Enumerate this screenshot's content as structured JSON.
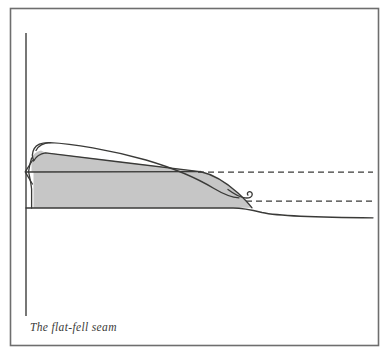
{
  "figure": {
    "caption": "The flat-fell seam",
    "background_color": "#ffffff",
    "frame": {
      "name": "figure-border",
      "color": "#6e6e6e",
      "x": 10.5,
      "y": 8.5,
      "width": 368,
      "height": 337,
      "stroke_width": 1.6
    },
    "ink_color": "#3a3a38",
    "fill_color": "#c6c6c6",
    "line_width": 1.3,
    "elements": {
      "vertical_rule": {
        "name": "vertical-reference-line",
        "label": "vertical reference line",
        "x": 26,
        "y_top": 33,
        "y_bottom": 316,
        "style": "solid",
        "color": "#4a4a48"
      },
      "shaded_body": {
        "name": "seam-shaded-body",
        "label": "shaded fabric cross-section",
        "fill": "#c6c6c6",
        "stroke": "#3a3a38"
      },
      "upper_fold": {
        "name": "upper-fold-outline",
        "label": "upper folded fabric edge",
        "style": "solid"
      },
      "fold_loop": {
        "name": "fold-loop",
        "label": "left-edge fold loop",
        "style": "solid"
      },
      "notch": {
        "name": "left-edge-notch",
        "label": "left edge V notch",
        "style": "solid"
      },
      "curl_hook": {
        "name": "fabric-curl-hook",
        "label": "raw edge curl hook",
        "style": "solid",
        "x": 248,
        "y": 194
      },
      "dashed_upper": {
        "name": "dashed-line-upper",
        "label": "hidden upper fabric edge",
        "style": "dashed",
        "x_start": 198,
        "x_end": 373,
        "y": 172,
        "dash_pattern": "6 4"
      },
      "dashed_lower": {
        "name": "dashed-line-lower",
        "label": "hidden lower fabric edge",
        "style": "dashed",
        "x_start": 246,
        "x_end": 373,
        "y": 201,
        "dash_pattern": "6 4"
      },
      "base_line": {
        "name": "base-fabric-line",
        "label": "base fabric lower edge",
        "style": "solid",
        "x_start": 26,
        "x_end": 373,
        "y": 208
      },
      "mid_line": {
        "name": "stitch-mid-line",
        "label": "stitch line across body",
        "style": "solid",
        "x_start": 26,
        "x_end": 200,
        "y": 172
      }
    }
  }
}
